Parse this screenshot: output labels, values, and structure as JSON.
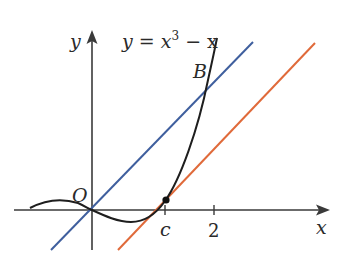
{
  "labels": {
    "equation_prefix": "y = x",
    "equation_exp": "3",
    "equation_suffix": " − x",
    "point_b": "B",
    "origin": "O",
    "x_axis": "x",
    "y_axis": "y",
    "tick_c": "c",
    "tick_2": "2"
  },
  "colors": {
    "axis": "#3a3a3a",
    "curve": "#1e1e1e",
    "line_y_eq_x": "#3f5f9e",
    "tangent_line": "#e06a3a",
    "point": "#111111"
  },
  "diagram": {
    "curve": "y = x^3 - x",
    "line_1": "y = x",
    "line_2": "tangent to curve at x = c, parallel to y = x",
    "intersection_point": "B",
    "tangent_point_x": "c",
    "x_ticks": [
      "c",
      "2"
    ]
  }
}
